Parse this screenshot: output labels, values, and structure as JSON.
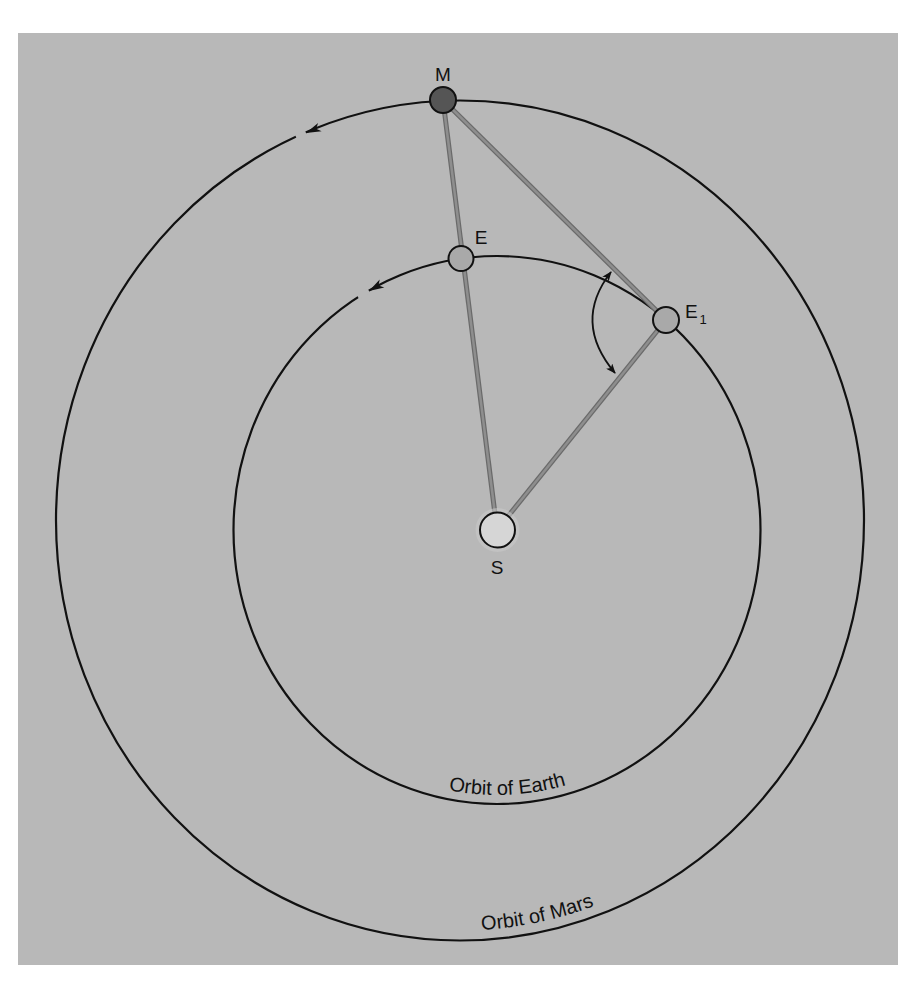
{
  "diagram": {
    "bodies": {
      "mars": {
        "label": "M"
      },
      "earth": {
        "label": "E"
      },
      "earth_later": {
        "label": "E",
        "subscript": "1"
      },
      "sun": {
        "label": "S"
      }
    },
    "orbits": {
      "earth": {
        "label": "Orbit of Earth"
      },
      "mars": {
        "label": "Orbit of Mars"
      }
    },
    "colors": {
      "background": "#b8b8b8",
      "page": "#ffffff",
      "orbit_stroke": "#111111",
      "sight_line_outer": "#6a6a6a",
      "sight_line_inner": "#8e8e8e",
      "mars_fill": "#555555",
      "earth_fill": "#a9a9a9",
      "sun_fill": "#d6d6d6",
      "sun_halo": "#c8c8c8"
    }
  }
}
